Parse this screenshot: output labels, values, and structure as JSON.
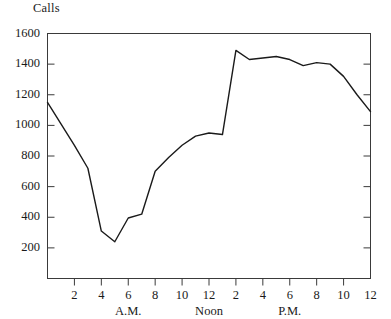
{
  "chart_data": {
    "type": "line",
    "title": "",
    "ylabel": "Calls",
    "xlabel": "",
    "ylim": [
      0,
      1600
    ],
    "xlim": [
      0,
      24
    ],
    "grid": false,
    "legend": null,
    "y_ticks": [
      200,
      400,
      600,
      800,
      1000,
      1200,
      1400,
      1600
    ],
    "y_tick_labels": [
      "200",
      "400",
      "600",
      "800",
      "1000",
      "1200",
      "1400",
      "1600"
    ],
    "x_ticks": [
      2,
      4,
      6,
      8,
      10,
      12,
      14,
      16,
      18,
      20,
      22,
      24
    ],
    "x_tick_labels": [
      "2",
      "4",
      "6",
      "8",
      "10",
      "12",
      "2",
      "4",
      "6",
      "8",
      "10",
      "12"
    ],
    "period_labels": [
      {
        "text": "A.M.",
        "x": 6
      },
      {
        "text": "Noon",
        "x": 12
      },
      {
        "text": "P.M.",
        "x": 18
      }
    ],
    "x": [
      0,
      1,
      2,
      3,
      4,
      5,
      6,
      7,
      8,
      9,
      10,
      11,
      12,
      13,
      14,
      15,
      16,
      17,
      18,
      19,
      20,
      21,
      22,
      23,
      24
    ],
    "values": [
      1150,
      1010,
      870,
      720,
      310,
      240,
      395,
      420,
      700,
      790,
      870,
      930,
      950,
      940,
      1490,
      1430,
      1440,
      1450,
      1430,
      1390,
      1410,
      1400,
      1320,
      1200,
      1090
    ],
    "series": [
      {
        "name": "Calls",
        "color": "#1a1a1a",
        "values": [
          1150,
          1010,
          870,
          720,
          310,
          240,
          395,
          420,
          700,
          790,
          870,
          930,
          950,
          940,
          1490,
          1430,
          1440,
          1450,
          1430,
          1390,
          1410,
          1400,
          1320,
          1200,
          1090
        ]
      }
    ],
    "annotations": []
  },
  "figure": {
    "axis_color": "#3a3a3a",
    "line_color": "#1a1a1a",
    "background": "#ffffff"
  }
}
